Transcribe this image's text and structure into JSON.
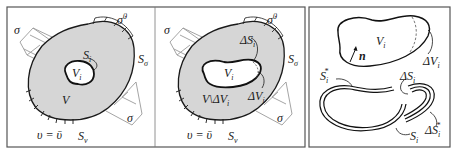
{
  "panels": [
    {
      "id": "left",
      "labels": {
        "sigma_top": "σ",
        "sigma_bottom": "σ",
        "sigma_dot": "σ̇",
        "sigma_dot_sup": "0",
        "S_sigma": "S",
        "S_sigma_sub": "σ",
        "S_i": "S",
        "S_i_sub": "i",
        "V_i": "V",
        "V_i_sub": "i",
        "V": "V",
        "v_eq": "υ = ῡ",
        "S_v": "S",
        "S_v_sub": "v"
      }
    },
    {
      "id": "middle",
      "labels": {
        "sigma_top": "σ",
        "sigma_bottom": "σ",
        "sigma_dot": "σ̇",
        "sigma_dot_sup": "0",
        "S_sigma": "S",
        "S_sigma_sub": "σ",
        "dS_i": "ΔS",
        "dS_i_sub": "i",
        "V_i": "V",
        "V_i_sub": "i",
        "dV_i": "ΔV",
        "dV_i_sub": "i",
        "V_minus": "V\\ΔV",
        "V_minus_sub": "i",
        "v_eq": "υ = ῡ",
        "S_v": "S",
        "S_v_sub": "v"
      }
    },
    {
      "id": "right",
      "labels": {
        "V_i": "V",
        "V_i_sub": "i",
        "n": "n",
        "dV_i": "ΔV",
        "dV_i_sub": "i",
        "S_i_star": "S",
        "S_i_star_sub": "i",
        "S_i_star_sup": "*",
        "dS_i": "ΔS",
        "dS_i_sub": "i",
        "dS_i_star": "ΔS",
        "dS_i_star_sub": "i",
        "dS_i_star_sup": "*",
        "S_i": "S",
        "S_i_sub": "i"
      }
    }
  ]
}
